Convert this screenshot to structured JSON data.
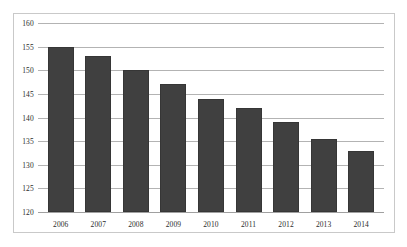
{
  "chart_data": {
    "type": "bar",
    "title": "",
    "xlabel": "",
    "ylabel": "",
    "categories": [
      "2006",
      "2007",
      "2008",
      "2009",
      "2010",
      "2011",
      "2012",
      "2013",
      "2014"
    ],
    "values": [
      155,
      153,
      150,
      147,
      144,
      142,
      139,
      135.5,
      133
    ],
    "ylim": [
      120,
      160
    ],
    "ytick_step": 5,
    "yticks": [
      "160",
      "155",
      "150",
      "145",
      "140",
      "135",
      "130",
      "125",
      "120"
    ],
    "ytick_values": [
      160,
      155,
      150,
      145,
      140,
      135,
      130,
      125,
      120
    ],
    "grid": true,
    "legend": false,
    "legend_position": "none",
    "bar_color": "#404040",
    "grid_color": "#b3b3b3",
    "border_color": "#c9c9c9",
    "background_color": "#ffffff",
    "text_color": "#2b2b2b"
  }
}
